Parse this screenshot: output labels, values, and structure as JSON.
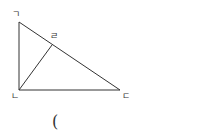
{
  "diagram": {
    "type": "right-triangle-with-altitude",
    "stroke_color": "#333333",
    "vertices": {
      "top": {
        "label": "ㄱ",
        "x": 19,
        "y": 22
      },
      "right_angle": {
        "label": "ㄴ",
        "x": 19,
        "y": 90
      },
      "right": {
        "label": "ㄷ",
        "x": 120,
        "y": 90
      },
      "foot": {
        "label": "ㄹ",
        "x": 52,
        "y": 45
      }
    },
    "segments": [
      {
        "from": "ㄱ",
        "to": "ㄴ"
      },
      {
        "from": "ㄴ",
        "to": "ㄷ"
      },
      {
        "from": "ㄱ",
        "to": "ㄷ"
      },
      {
        "from": "ㄴ",
        "to": "ㄹ"
      }
    ],
    "caption": "("
  }
}
